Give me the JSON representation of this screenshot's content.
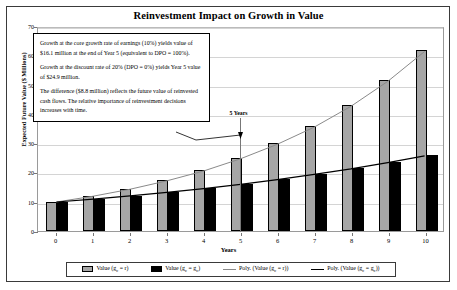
{
  "chart_data": {
    "type": "bar",
    "title": "Reinvestment Impact on Growth in Value",
    "xlabel": "Years",
    "ylabel": "Expected Future Value ($ Millions)",
    "categories": [
      "0",
      "1",
      "2",
      "3",
      "4",
      "5",
      "6",
      "7",
      "8",
      "9",
      "10"
    ],
    "ylim": [
      0,
      70
    ],
    "ytick_values": [
      "0",
      "10",
      "20",
      "30",
      "40",
      "50",
      "60",
      "70"
    ],
    "grid": true,
    "legend_position": "bottom",
    "series": [
      {
        "name": "Value (gc = r)",
        "type": "bar",
        "color": "#a6a6a6",
        "values": [
          10.0,
          12.0,
          14.4,
          17.3,
          20.7,
          24.9,
          29.9,
          35.8,
          43.0,
          51.6,
          61.9
        ]
      },
      {
        "name": "Value (gc = gc)",
        "type": "bar",
        "color": "#000000",
        "values": [
          10.0,
          11.0,
          12.1,
          13.3,
          14.6,
          16.1,
          17.7,
          19.5,
          21.4,
          23.6,
          25.9
        ]
      },
      {
        "name": "Poly. (Value (gc = r))",
        "type": "line",
        "color": "#8a8a8a",
        "values": [
          10.0,
          12.0,
          14.4,
          17.3,
          20.7,
          24.9,
          29.9,
          35.8,
          43.0,
          51.6,
          61.9
        ]
      },
      {
        "name": "Poly. (Value (gc = gc))",
        "type": "line",
        "color": "#000000",
        "values": [
          10.0,
          11.0,
          12.1,
          13.3,
          14.6,
          16.1,
          17.7,
          19.5,
          21.4,
          23.6,
          25.9
        ]
      }
    ],
    "annotations": [
      {
        "name": "five-years-marker",
        "text": "5 Years",
        "x": "5"
      }
    ]
  },
  "annotation": {
    "para1": "Growth at the core growth rate of earnings (10%) yields value of $16.1 million at the end of Year 5 (equivalent to DPO = 100%).",
    "para2": "Growth at the discount rate of 20% (DPO = 0%) yields Year 5 value of $24.9 million.",
    "para3": "The difference ($8.8 million) reflects the future value of reinvested cash flows. The relative importance of reinvestment decisions increases with time."
  },
  "legend": {
    "items": [
      {
        "label_pre": "Value (g",
        "label_sub": "c",
        "label_post": " = r)",
        "marker": "box-gray"
      },
      {
        "label_pre": "Value (g",
        "label_sub": "c",
        "label_post": " = g",
        "label_sub2": "c",
        "label_post2": ")",
        "marker": "box-black"
      },
      {
        "label_pre": "Poly. (Value (g",
        "label_sub": "c",
        "label_post": " = r))",
        "marker": "line-gray"
      },
      {
        "label_pre": "Poly. (Value (g",
        "label_sub": "c",
        "label_post": " = g",
        "label_sub2": "c",
        "label_post2": "))",
        "marker": "line-black"
      }
    ]
  }
}
